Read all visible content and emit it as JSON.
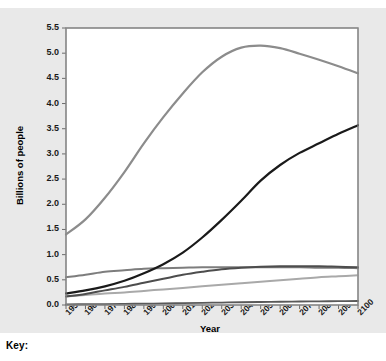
{
  "figure": {
    "background_color": "#e9e9e9",
    "plot_background_color": "#ffffff"
  },
  "key": {
    "label": "Key:"
  },
  "chart_data": {
    "type": "line",
    "title": "",
    "xlabel": "Year",
    "ylabel": "Billions of people",
    "xlim": [
      1950,
      2100
    ],
    "ylim": [
      0.0,
      5.5
    ],
    "xticks": [
      "1950",
      "1960",
      "1970",
      "1980",
      "1990",
      "2000",
      "2010",
      "2020",
      "2030",
      "2040",
      "2050",
      "2060",
      "2070",
      "2080",
      "2090",
      "2100"
    ],
    "yticks": [
      "0.0",
      "0.5",
      "1.0",
      "1.5",
      "2.0",
      "2.5",
      "3.0",
      "3.5",
      "4.0",
      "4.5",
      "5.0",
      "5.5"
    ],
    "grid": false,
    "legend_position": "below-key",
    "x": [
      1950,
      1960,
      1970,
      1980,
      1990,
      2000,
      2010,
      2020,
      2030,
      2040,
      2050,
      2060,
      2070,
      2080,
      2090,
      2100
    ],
    "series": [
      {
        "name": "Asia",
        "color": "#8c8c8c",
        "width": 2.2,
        "values": [
          1.4,
          1.7,
          2.13,
          2.64,
          3.21,
          3.73,
          4.2,
          4.62,
          4.93,
          5.11,
          5.15,
          5.1,
          4.99,
          4.87,
          4.74,
          4.6
        ]
      },
      {
        "name": "Africa",
        "color": "#1a1a1a",
        "width": 2.2,
        "values": [
          0.23,
          0.29,
          0.37,
          0.48,
          0.63,
          0.81,
          1.04,
          1.34,
          1.69,
          2.07,
          2.47,
          2.78,
          3.02,
          3.21,
          3.4,
          3.57
        ]
      },
      {
        "name": "Europe",
        "color": "#7d7d7d",
        "width": 2.0,
        "values": [
          0.55,
          0.6,
          0.66,
          0.69,
          0.72,
          0.73,
          0.74,
          0.75,
          0.75,
          0.75,
          0.75,
          0.75,
          0.75,
          0.74,
          0.74,
          0.73
        ]
      },
      {
        "name": "Latin America and the Caribbean",
        "color": "#4d4d4d",
        "width": 2.0,
        "values": [
          0.17,
          0.22,
          0.29,
          0.36,
          0.44,
          0.52,
          0.6,
          0.66,
          0.71,
          0.74,
          0.76,
          0.77,
          0.77,
          0.77,
          0.76,
          0.75
        ]
      },
      {
        "name": "Northern America",
        "color": "#a9a9a9",
        "width": 2.0,
        "values": [
          0.17,
          0.2,
          0.23,
          0.25,
          0.28,
          0.31,
          0.34,
          0.37,
          0.4,
          0.43,
          0.46,
          0.49,
          0.52,
          0.55,
          0.57,
          0.59
        ]
      },
      {
        "name": "Oceania",
        "color": "#595959",
        "width": 1.8,
        "values": [
          0.013,
          0.016,
          0.019,
          0.023,
          0.027,
          0.031,
          0.037,
          0.043,
          0.049,
          0.055,
          0.06,
          0.065,
          0.069,
          0.073,
          0.076,
          0.079
        ]
      }
    ]
  }
}
